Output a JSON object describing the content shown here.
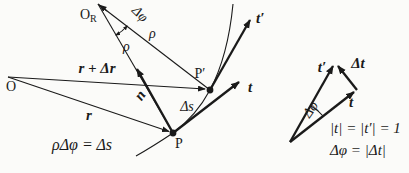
{
  "colors": {
    "ink": "#1a1a1a",
    "background": "#fbfbf9"
  },
  "figure": {
    "left": {
      "labels": {
        "origin": "O",
        "curvature_center_main": "O",
        "curvature_center_sub": "R",
        "point_p": "P",
        "point_p_prime": "P′",
        "radius_upper_right": "ρ",
        "radius_lower_left": "ρ",
        "delta_phi": "Δφ",
        "r_plus_dr": "r + Δr",
        "r": "r",
        "normal": "n",
        "delta_s": "Δs",
        "tangent": "t",
        "tangent_prime": "t′",
        "equation": "ρΔφ = Δs"
      }
    },
    "right": {
      "labels": {
        "tangent_prime": "t′",
        "delta_t": "Δt",
        "tangent": "t",
        "delta_phi": "Δφ",
        "eq_unit_magnitudes": "|t| = |t′| = 1",
        "eq_delta_phi": "Δφ = |Δt|"
      }
    }
  }
}
